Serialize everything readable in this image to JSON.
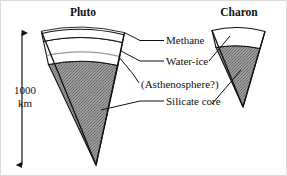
{
  "figure": {
    "background_color": "#ffffff",
    "line_color": "#111111",
    "core_fill_color": "#8c8c8c",
    "shell_fill_color": "#ffffff"
  },
  "bodies": [
    {
      "name": "Pluto",
      "title_label": "Pluto",
      "layers": [
        "Methane",
        "Water-ice",
        "(Asthenosphere?)",
        "Silicate core"
      ]
    },
    {
      "name": "Charon",
      "title_label": "Charon",
      "layers": [
        "Water-ice",
        "Silicate core"
      ]
    }
  ],
  "labels": {
    "methane": "Methane",
    "water_ice": "Water-ice",
    "asthenosphere": "(Asthenosphere?)",
    "silicate_core": "Silicate core"
  },
  "scale": {
    "value": "1000",
    "unit": "km"
  }
}
